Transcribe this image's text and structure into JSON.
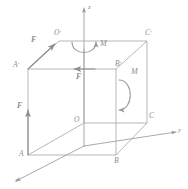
{
  "figure": {
    "type": "3d-cube-force-moment-diagram",
    "stroke_color": "#9a9a9a",
    "label_color": "#8d8d8d",
    "background": "#ffffff",
    "axes": [
      {
        "id": "x",
        "label": "x",
        "direction": "down-left",
        "from": [
          84,
          146
        ],
        "to": [
          14,
          182
        ]
      },
      {
        "id": "y",
        "label": "y",
        "direction": "right",
        "from": [
          84,
          146
        ],
        "to": [
          178,
          132
        ]
      },
      {
        "id": "z",
        "label": "z",
        "direction": "up",
        "from": [
          84,
          146
        ],
        "to": [
          84,
          6
        ]
      }
    ],
    "vertices": [
      {
        "id": "O",
        "label": "O",
        "x": 84,
        "y": 123,
        "label_x": 75,
        "label_y": 117
      },
      {
        "id": "A",
        "label": "A",
        "x": 28,
        "y": 155,
        "label_x": 20,
        "label_y": 152
      },
      {
        "id": "B",
        "label": "B",
        "x": 116,
        "y": 155,
        "label_x": 115,
        "label_y": 158
      },
      {
        "id": "C",
        "label": "C",
        "x": 147,
        "y": 123,
        "label_x": 148,
        "label_y": 114
      },
      {
        "id": "O'",
        "label": "O",
        "prime": true,
        "x": 59,
        "y": 41,
        "label_x": 55,
        "label_y": 31
      },
      {
        "id": "A'",
        "label": "A",
        "prime": true,
        "x": 28,
        "y": 69,
        "label_x": 15,
        "label_y": 63
      },
      {
        "id": "B'",
        "label": "B",
        "prime": true,
        "x": 116,
        "y": 69,
        "label_x": 116,
        "label_y": 62
      },
      {
        "id": "C'",
        "label": "C",
        "prime": true,
        "x": 147,
        "y": 41,
        "label_x": 146,
        "label_y": 31
      }
    ],
    "forces": [
      {
        "id": "F-top-diagonal",
        "label": "F",
        "label_x": 33,
        "label_y": 39,
        "from": [
          28,
          69
        ],
        "to": [
          59,
          41
        ]
      },
      {
        "id": "F-top-edge",
        "label": "F",
        "label_x": 76,
        "label_y": 72,
        "from": [
          95,
          69
        ],
        "to": [
          78,
          69
        ]
      },
      {
        "id": "F-vertical",
        "label": "F",
        "label_x": 19,
        "label_y": 106,
        "from": [
          28,
          155
        ],
        "to": [
          28,
          113
        ]
      }
    ],
    "moments": [
      {
        "id": "M-top-face",
        "label": "M",
        "label_x": 102,
        "label_y": 44,
        "cx": 84,
        "cy": 49,
        "rx": 12,
        "ry": 9,
        "orientation": "horizontal"
      },
      {
        "id": "M-right-face",
        "label": "M",
        "label_x": 133,
        "label_y": 74,
        "cx": 125,
        "cy": 94,
        "rx": 9,
        "ry": 15,
        "orientation": "vertical"
      }
    ],
    "edges": [
      {
        "from": "A",
        "to": "B",
        "style": "solid"
      },
      {
        "from": "B",
        "to": "C",
        "style": "solid"
      },
      {
        "from": "O",
        "to": "C",
        "style": "solid"
      },
      {
        "from": "O",
        "to": "A",
        "style": "solid"
      },
      {
        "from": "A'",
        "to": "B'",
        "style": "solid"
      },
      {
        "from": "B'",
        "to": "C'",
        "style": "solid"
      },
      {
        "from": "O'",
        "to": "C'",
        "style": "solid"
      },
      {
        "from": "O'",
        "to": "A'",
        "style": "solid"
      },
      {
        "from": "A",
        "to": "A'",
        "style": "solid"
      },
      {
        "from": "B",
        "to": "B'",
        "style": "solid"
      },
      {
        "from": "C",
        "to": "C'",
        "style": "solid"
      },
      {
        "from": "O",
        "to": "O'",
        "style": "solid"
      }
    ]
  }
}
